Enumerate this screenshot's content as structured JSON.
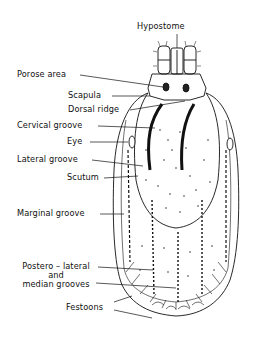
{
  "figure": {
    "labels": {
      "hypostome": "Hypostome",
      "porose_area": "Porose area",
      "scapula": "Scapula",
      "dorsal_ridge": "Dorsal ridge",
      "cervical_groove": "Cervical groove",
      "eye": "Eye",
      "lateral_groove": "Lateral groove",
      "scutum": "Scutum",
      "marginal_groove": "Marginal groove",
      "postero_lateral_1": "Postero – lateral",
      "postero_lateral_2": "and",
      "postero_lateral_3": "median grooves",
      "festoons": "Festoons"
    },
    "colors": {
      "ink": "#111111",
      "background": "#ffffff"
    }
  }
}
